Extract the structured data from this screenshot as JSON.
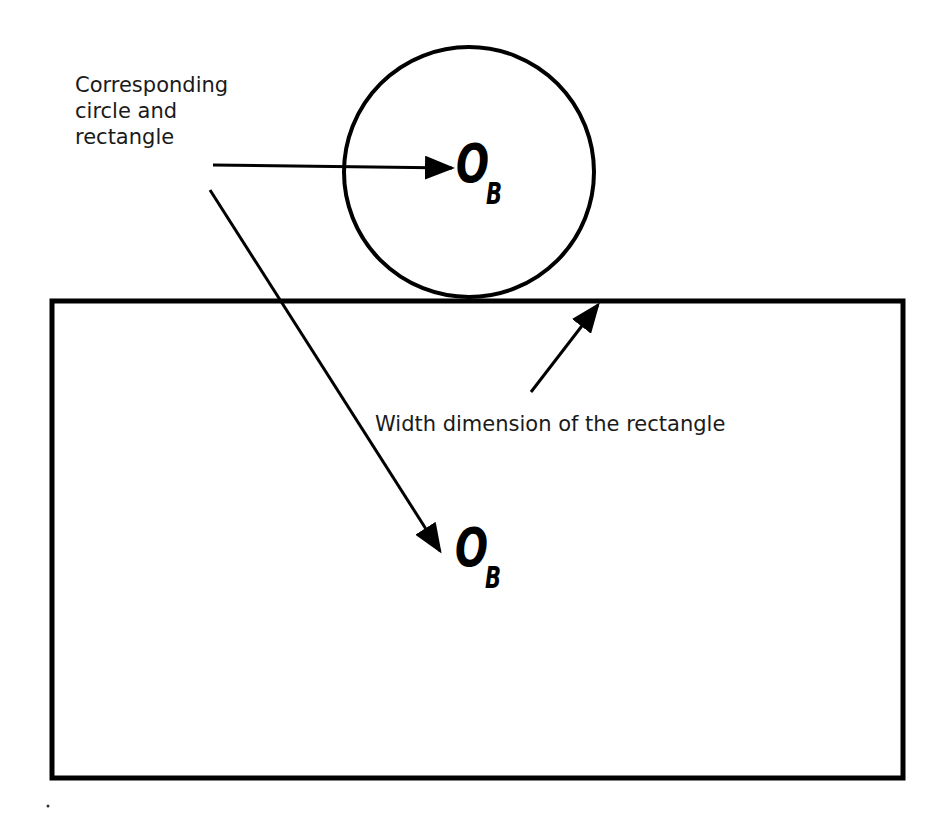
{
  "diagram": {
    "labels": {
      "corresponding": "Corresponding\ncircle and\nrectangle",
      "width_dimension": "Width dimension of the rectangle"
    },
    "circle_center": {
      "symbol": "O",
      "subscript": "B"
    },
    "rectangle_center": {
      "symbol": "O",
      "subscript": "B"
    },
    "shapes": {
      "circle": {
        "cx": 469,
        "cy": 172,
        "r": 125
      },
      "rectangle": {
        "x": 52,
        "y": 301,
        "width": 851,
        "height": 477
      }
    },
    "colors": {
      "stroke": "#000000",
      "background": "#ffffff",
      "text": "#1a1a1a"
    }
  }
}
